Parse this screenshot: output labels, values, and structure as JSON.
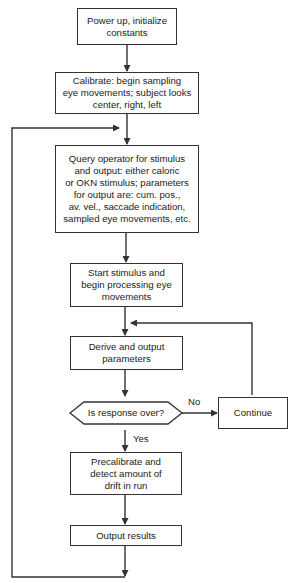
{
  "flowchart": {
    "nodes": {
      "power_up": "Power up, initialize\nconstants",
      "calibrate": "Calibrate:  begin sampling\neye movements; subject looks\ncenter, right, left",
      "query": "Query operator for stimulus\nand output:  either caloric\nor OKN stimulus; parameters\nfor output are: cum. pos.,\nav. vel., saccade indication,\nsampled eye movements, etc.",
      "start": "Start stimulus and\nbegin processing eye\nmovements",
      "derive": "Derive and output\nparameters",
      "decision": "Is response over?",
      "continue": "Continue",
      "precalibrate": "Precalibrate and\ndetect amount of\ndrift in run",
      "output": "Output results"
    },
    "edge_labels": {
      "no": "No",
      "yes": "Yes"
    },
    "line_color": "#333333"
  }
}
